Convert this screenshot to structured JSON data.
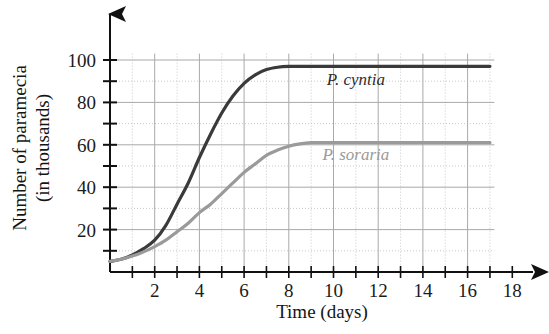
{
  "chart_data": {
    "type": "line",
    "title": "",
    "xlabel": "Time (days)",
    "ylabel": "Number of paramecia (in thousands)",
    "ylabel_line1": "Number of paramecia",
    "ylabel_line2": "(in thousands)",
    "xlim": [
      0,
      18
    ],
    "ylim": [
      0,
      110
    ],
    "xticks": [
      1,
      2,
      3,
      4,
      5,
      6,
      7,
      8,
      9,
      10,
      11,
      12,
      13,
      14,
      15,
      16,
      17,
      18
    ],
    "xtick_labels": [
      "",
      "2",
      "",
      "4",
      "",
      "6",
      "",
      "8",
      "",
      "10",
      "",
      "12",
      "",
      "14",
      "",
      "16",
      "",
      "18"
    ],
    "yticks": [
      10,
      20,
      30,
      40,
      50,
      60,
      70,
      80,
      90,
      100
    ],
    "ytick_labels": [
      "",
      "20",
      "",
      "40",
      "",
      "60",
      "",
      "80",
      "",
      "100"
    ],
    "grid": true,
    "grid_major_x_step": 2,
    "grid_major_y_step": 20,
    "grid_minor_x_step": 1,
    "grid_minor_y_step": 10,
    "legend_position": "inline-annotation",
    "series": [
      {
        "name": "P. cyntia",
        "color": "#3a3a3a",
        "label_x": 11.0,
        "label_y": 88,
        "plateau": 97,
        "x": [
          0,
          0.5,
          1,
          1.5,
          2,
          2.5,
          3,
          3.5,
          4,
          4.5,
          5,
          5.5,
          6,
          6.5,
          7,
          7.5,
          8,
          8.5,
          9,
          10,
          11,
          12,
          13,
          14,
          15,
          16,
          17
        ],
        "values": [
          5,
          6,
          8,
          11,
          15,
          22,
          32,
          42,
          54,
          65,
          75,
          83,
          89,
          93,
          95.5,
          96.6,
          97,
          97,
          97,
          97,
          97,
          97,
          97,
          97,
          97,
          97,
          97
        ]
      },
      {
        "name": "P. soraria",
        "color": "#9a9a9a",
        "label_x": 11.0,
        "label_y": 53,
        "plateau": 61,
        "x": [
          0,
          0.5,
          1,
          1.5,
          2,
          2.5,
          3,
          3.5,
          4,
          4.5,
          5,
          5.5,
          6,
          6.5,
          7,
          7.5,
          8,
          8.5,
          9,
          9.5,
          10,
          11,
          12,
          13,
          14,
          15,
          16,
          17
        ],
        "values": [
          5,
          6,
          7.5,
          9.5,
          12,
          15,
          19,
          23,
          28,
          32,
          37,
          42,
          47,
          51,
          55,
          57.5,
          59.3,
          60.4,
          61,
          61,
          61,
          61,
          61,
          61,
          61,
          61,
          61,
          61
        ]
      }
    ]
  },
  "axes": {
    "x_axis_name": "time-axis",
    "y_axis_name": "paramecia-axis"
  }
}
